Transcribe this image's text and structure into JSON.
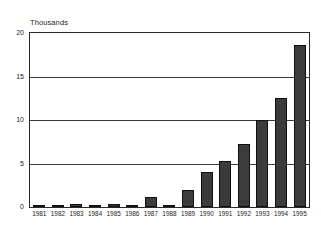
{
  "chart_data": {
    "type": "bar",
    "title": "",
    "subtitle": "",
    "unit_caption": "Thousands",
    "xlabel": "",
    "ylabel": "",
    "ylim": [
      0,
      20
    ],
    "yticks": [
      20,
      15,
      10,
      5,
      0
    ],
    "ytick_labels": [
      "20",
      "15",
      "10",
      "5",
      "0"
    ],
    "grid": true,
    "legend": false,
    "legend_position": "none",
    "bar_color": "#3b3b3b",
    "bar_edge_color": "#101010",
    "axis_color": "#2a2a2a",
    "background_color": "#ffffff",
    "categories": [
      "1981",
      "1982",
      "1983",
      "1984",
      "1985",
      "1986",
      "1987",
      "1988",
      "1989",
      "1990",
      "1991",
      "1992",
      "1993",
      "1994",
      "1995"
    ],
    "values": [
      0.05,
      0.15,
      0.3,
      0.15,
      0.35,
      0.1,
      1.2,
      0.15,
      2.0,
      4.0,
      5.3,
      7.2,
      10.0,
      12.5,
      18.5
    ]
  }
}
